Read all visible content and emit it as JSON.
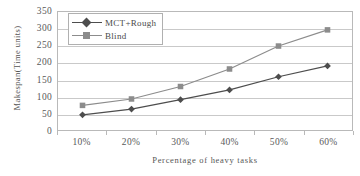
{
  "chart_data": {
    "type": "line",
    "title": "",
    "xlabel": "Percentage of heavy tasks",
    "ylabel": "Makespan(Time units)",
    "categories": [
      "10%",
      "20%",
      "30%",
      "40%",
      "50%",
      "60%"
    ],
    "ylim": [
      0,
      350
    ],
    "ytick_labels": [
      "0",
      "50",
      "100",
      "150",
      "200",
      "250",
      "300",
      "350"
    ],
    "ytick_values": [
      0,
      50,
      100,
      150,
      200,
      250,
      300,
      350
    ],
    "grid": true,
    "legend_position": "top-left",
    "series": [
      {
        "name": "MCT+Rough",
        "marker": "diamond",
        "color": "#4d4d4d",
        "values": [
          45,
          62,
          90,
          119,
          158,
          190
        ]
      },
      {
        "name": "Blind",
        "marker": "square",
        "color": "#8c8c8c",
        "values": [
          73,
          92,
          129,
          181,
          249,
          297
        ]
      }
    ]
  },
  "legend": {
    "items": [
      {
        "label": "MCT+Rough"
      },
      {
        "label": "Blind"
      }
    ]
  },
  "colors": {
    "series_mct": "#4d4d4d",
    "series_blind": "#8c8c8c",
    "grid": "#c9c9c9",
    "axis": "#b9b9b9",
    "text": "#595959"
  }
}
